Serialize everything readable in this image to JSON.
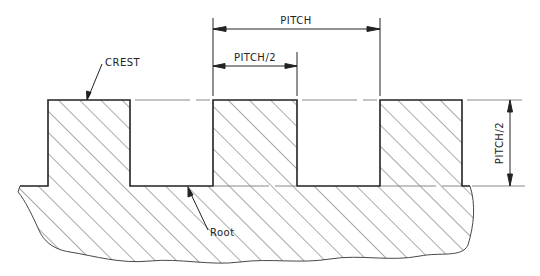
{
  "diagram": {
    "labels": {
      "pitch": "PITCH",
      "half_pitch_top": "PITCH/2",
      "half_pitch_side": "PITCH/2",
      "crest": "CREST",
      "root": "Root"
    },
    "geometry": {
      "crest_y": 100,
      "root_y": 186,
      "teeth": [
        {
          "x1": 48,
          "x2": 130
        },
        {
          "x1": 213,
          "x2": 297
        },
        {
          "x1": 380,
          "x2": 462
        }
      ]
    },
    "colors": {
      "line": "#222222",
      "hatch": "#555555",
      "background": "#ffffff"
    }
  }
}
